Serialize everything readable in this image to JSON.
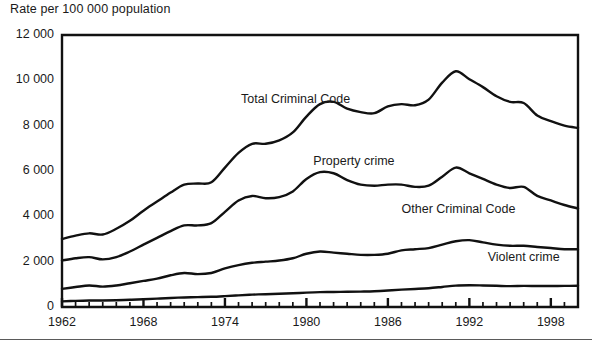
{
  "chart_data": {
    "type": "line",
    "title": "Rate per 100 000 population",
    "xlabel": "",
    "ylabel": "Rate per 100 000 population",
    "xlim": [
      1962,
      2000
    ],
    "ylim": [
      0,
      12000
    ],
    "ytick_values": [
      0,
      2000,
      4000,
      6000,
      8000,
      10000,
      12000
    ],
    "ytick_labels": [
      "0",
      "2 000",
      "4 000",
      "6 000",
      "8 000",
      "10 000",
      "12 000"
    ],
    "xtick_values": [
      1962,
      1968,
      1974,
      1980,
      1986,
      1992,
      1998
    ],
    "xtick_labels": [
      "1962",
      "1968",
      "1974",
      "1980",
      "1986",
      "1992",
      "1998"
    ],
    "xtick_minor_step": 1,
    "grid": false,
    "legend_position": "inline-annotations",
    "x": [
      1962,
      1963,
      1964,
      1965,
      1966,
      1967,
      1968,
      1969,
      1970,
      1971,
      1972,
      1973,
      1974,
      1975,
      1976,
      1977,
      1978,
      1979,
      1980,
      1981,
      1982,
      1983,
      1984,
      1985,
      1986,
      1987,
      1988,
      1989,
      1990,
      1991,
      1992,
      1993,
      1994,
      1995,
      1996,
      1997,
      1998,
      1999,
      2000
    ],
    "series": [
      {
        "name": "Total Criminal Code",
        "label": "Total Criminal Code",
        "label_x": 1979.2,
        "label_y": 9150,
        "values": [
          3000,
          3150,
          3250,
          3200,
          3450,
          3800,
          4250,
          4650,
          5050,
          5400,
          5450,
          5500,
          6150,
          6800,
          7200,
          7200,
          7350,
          7700,
          8400,
          8950,
          9050,
          8750,
          8600,
          8550,
          8850,
          8950,
          8900,
          9150,
          9900,
          10400,
          10050,
          9700,
          9300,
          9050,
          9000,
          8450,
          8200,
          8000,
          7900
        ]
      },
      {
        "name": "Property crime",
        "label": "Property crime",
        "label_x": 1983.5,
        "label_y": 6400,
        "values": [
          2050,
          2150,
          2200,
          2100,
          2200,
          2450,
          2750,
          3050,
          3350,
          3600,
          3600,
          3700,
          4200,
          4700,
          4900,
          4800,
          4850,
          5100,
          5650,
          5950,
          5900,
          5600,
          5400,
          5350,
          5400,
          5400,
          5300,
          5350,
          5750,
          6150,
          5900,
          5650,
          5400,
          5250,
          5300,
          4900,
          4700,
          4500,
          4350
        ]
      },
      {
        "name": "Other Criminal Code",
        "label": "Other Criminal Code",
        "label_x": 1991.2,
        "label_y": 4300,
        "values": [
          800,
          880,
          950,
          900,
          950,
          1050,
          1150,
          1250,
          1400,
          1500,
          1450,
          1500,
          1700,
          1850,
          1950,
          2000,
          2050,
          2150,
          2350,
          2450,
          2400,
          2350,
          2300,
          2300,
          2350,
          2500,
          2550,
          2600,
          2750,
          2900,
          2950,
          2850,
          2750,
          2700,
          2700,
          2650,
          2600,
          2550,
          2550
        ]
      },
      {
        "name": "Violent crime",
        "label": "Violent crime",
        "label_x": 1996.0,
        "label_y": 2150,
        "values": [
          250,
          270,
          285,
          290,
          300,
          320,
          345,
          370,
          400,
          420,
          435,
          450,
          480,
          515,
          545,
          565,
          585,
          605,
          635,
          655,
          665,
          670,
          680,
          695,
          725,
          765,
          795,
          830,
          885,
          945,
          960,
          950,
          935,
          920,
          930,
          925,
          925,
          930,
          935
        ]
      }
    ],
    "line_color": "#111111",
    "axis_color": "#111111",
    "background_color": "#ffffff"
  }
}
